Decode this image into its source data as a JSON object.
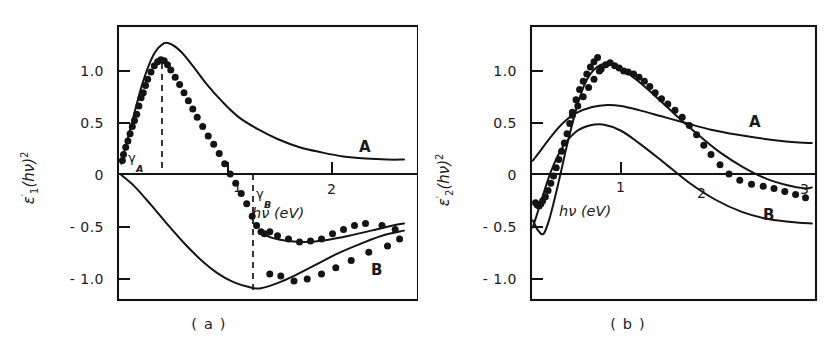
{
  "figure": {
    "background": "#ffffff",
    "ink_color": "#141414"
  },
  "panels": [
    {
      "id": "a",
      "caption": "( a )",
      "y_axis": {
        "label_main": "ε",
        "label_prime": "′",
        "label_sub": "1",
        "label_arg": "(hν)",
        "label_sup": "2",
        "ticks": [
          "1.0",
          "0.5",
          "0",
          "- 0.5",
          "- 1.0"
        ],
        "tick_values": [
          1.0,
          0.5,
          0,
          -0.5,
          -1.0
        ],
        "range": [
          -1.15,
          1.38
        ]
      },
      "x_axis": {
        "label": "hν  (eV)",
        "ticks": [
          "1",
          "2"
        ],
        "tick_values": [
          1,
          2
        ],
        "range": [
          0,
          2.62
        ]
      },
      "annotations": [
        {
          "name": "gamma-a",
          "symbol": "γ",
          "subscript": "A",
          "x": 0.42
        },
        {
          "name": "gamma-b",
          "symbol": "γ",
          "subscript": "B",
          "x": 1.28
        }
      ],
      "curve_labels": [
        {
          "name": "A",
          "x": 2.12,
          "y": 0.22
        },
        {
          "name": "B",
          "x": 2.23,
          "y": -0.78
        }
      ]
    },
    {
      "id": "b",
      "caption": "( b )",
      "y_axis": {
        "label_main": "ε",
        "label_prime": "′",
        "label_sub": "2",
        "label_arg": "(hν)",
        "label_sup": "2",
        "ticks": [
          "1.0",
          "0.5",
          "0",
          "- 0.5",
          "- 1.0"
        ],
        "tick_values": [
          1.0,
          0.5,
          0,
          -0.5,
          -1.0
        ],
        "range": [
          -1.15,
          1.38
        ]
      },
      "x_axis": {
        "label": "hν  (eV)",
        "ticks": [
          "1",
          "2",
          "3"
        ],
        "tick_values": [
          1,
          2,
          3
        ],
        "range": [
          0,
          3.15
        ]
      },
      "annotations": [],
      "curve_labels": [
        {
          "name": "A",
          "x": 2.4,
          "y": 0.44
        },
        {
          "name": "B",
          "x": 2.62,
          "y": -0.3
        }
      ]
    }
  ],
  "chart_data": [
    {
      "type": "line",
      "panel": "a",
      "title": "",
      "xlabel": "hν  (eV)",
      "ylabel": "ε′₁(hν)²",
      "xlim": [
        0,
        2.62
      ],
      "ylim": [
        -1.15,
        1.38
      ],
      "grid": false,
      "legend": "inline-curve-labels",
      "annotations": [
        {
          "label": "γ_A",
          "x": 0.42,
          "style": "vertical-dashed"
        },
        {
          "label": "γ_B",
          "x": 1.28,
          "style": "vertical-dashed"
        }
      ],
      "series": [
        {
          "name": "A",
          "style": "line",
          "x": [
            0.03,
            0.12,
            0.22,
            0.32,
            0.42,
            0.5,
            0.58,
            0.68,
            0.8,
            0.95,
            1.1,
            1.28,
            1.45,
            1.65,
            1.85,
            2.05,
            2.25,
            2.45,
            2.6
          ],
          "y": [
            0.1,
            0.47,
            0.87,
            1.15,
            1.27,
            1.25,
            1.18,
            1.05,
            0.88,
            0.7,
            0.55,
            0.43,
            0.34,
            0.26,
            0.21,
            0.17,
            0.15,
            0.14,
            0.14
          ]
        },
        {
          "name": "B",
          "style": "line",
          "x": [
            0.03,
            0.15,
            0.3,
            0.45,
            0.6,
            0.75,
            0.9,
            1.05,
            1.2,
            1.3,
            1.45,
            1.6,
            1.8,
            2.0,
            2.2,
            2.4,
            2.6
          ],
          "y": [
            -0.01,
            -0.12,
            -0.3,
            -0.49,
            -0.67,
            -0.83,
            -0.96,
            -1.05,
            -1.1,
            -1.11,
            -1.06,
            -0.99,
            -0.88,
            -0.77,
            -0.68,
            -0.6,
            -0.55
          ]
        },
        {
          "name": "fit-lower-A",
          "style": "line",
          "x": [
            1.28,
            1.4,
            1.55,
            1.7,
            1.9,
            2.1,
            2.3,
            2.5,
            2.6
          ],
          "y": [
            -0.56,
            -0.62,
            -0.65,
            -0.66,
            -0.64,
            -0.6,
            -0.55,
            -0.5,
            -0.48
          ]
        },
        {
          "name": "data-points",
          "style": "scatter",
          "x": [
            0.04,
            0.05,
            0.07,
            0.09,
            0.11,
            0.13,
            0.15,
            0.17,
            0.19,
            0.21,
            0.23,
            0.25,
            0.27,
            0.3,
            0.33,
            0.36,
            0.39,
            0.42,
            0.45,
            0.48,
            0.52,
            0.56,
            0.6,
            0.64,
            0.68,
            0.72,
            0.77,
            0.82,
            0.87,
            0.92,
            0.97,
            1.02,
            1.07,
            1.12,
            1.17,
            1.22,
            1.26,
            1.3,
            1.33,
            1.38,
            1.45,
            1.55,
            1.65,
            1.75,
            1.85,
            1.95,
            2.05,
            2.15,
            2.25,
            2.4,
            2.52,
            1.38,
            1.48,
            1.6,
            1.72,
            1.85,
            1.98,
            2.12,
            2.28,
            2.45,
            2.56
          ],
          "y": [
            0.13,
            0.19,
            0.26,
            0.32,
            0.39,
            0.46,
            0.52,
            0.58,
            0.66,
            0.74,
            0.79,
            0.86,
            0.92,
            0.99,
            1.05,
            1.09,
            1.11,
            1.1,
            1.06,
            1.01,
            0.94,
            0.87,
            0.79,
            0.71,
            0.63,
            0.55,
            0.46,
            0.37,
            0.29,
            0.2,
            0.1,
            0.0,
            -0.09,
            -0.19,
            -0.29,
            -0.41,
            -0.5,
            -0.56,
            -0.58,
            -0.56,
            -0.6,
            -0.63,
            -0.66,
            -0.65,
            -0.63,
            -0.58,
            -0.54,
            -0.5,
            -0.48,
            -0.5,
            -0.54,
            -0.97,
            -0.99,
            -1.04,
            -1.02,
            -0.97,
            -0.91,
            -0.84,
            -0.76,
            -0.7,
            -0.63
          ]
        }
      ]
    },
    {
      "type": "line",
      "panel": "b",
      "title": "",
      "xlabel": "hν  (eV)",
      "ylabel": "ε′₂(hν)²",
      "xlim": [
        0,
        3.15
      ],
      "ylim": [
        -1.15,
        1.38
      ],
      "grid": false,
      "legend": "inline-curve-labels",
      "annotations": [],
      "series": [
        {
          "name": "A",
          "style": "line",
          "x": [
            0.02,
            0.1,
            0.22,
            0.35,
            0.5,
            0.68,
            0.85,
            1.0,
            1.2,
            1.45,
            1.7,
            2.0,
            2.3,
            2.6,
            2.9,
            3.12
          ],
          "y": [
            0.13,
            0.22,
            0.36,
            0.49,
            0.59,
            0.65,
            0.67,
            0.66,
            0.62,
            0.56,
            0.5,
            0.43,
            0.38,
            0.34,
            0.31,
            0.3
          ]
        },
        {
          "name": "B",
          "style": "line",
          "x": [
            0.02,
            0.1,
            0.22,
            0.35,
            0.5,
            0.65,
            0.8,
            1.0,
            1.2,
            1.45,
            1.75,
            2.05,
            2.35,
            2.65,
            2.95,
            3.12
          ],
          "y": [
            -0.52,
            -0.3,
            0.02,
            0.26,
            0.41,
            0.47,
            0.48,
            0.42,
            0.3,
            0.13,
            -0.08,
            -0.25,
            -0.37,
            -0.44,
            -0.47,
            -0.48
          ]
        },
        {
          "name": "fit-main",
          "style": "line",
          "x": [
            0.02,
            0.08,
            0.14,
            0.2,
            0.26,
            0.32,
            0.4,
            0.5,
            0.6,
            0.72,
            0.85,
            1.0,
            1.15,
            1.3,
            1.5,
            1.7,
            1.9,
            2.1,
            2.35,
            2.6,
            2.85,
            3.05,
            3.12
          ],
          "y": [
            -0.45,
            -0.55,
            -0.58,
            -0.45,
            -0.25,
            -0.03,
            0.28,
            0.62,
            0.88,
            1.03,
            1.07,
            1.02,
            0.93,
            0.82,
            0.66,
            0.5,
            0.35,
            0.21,
            0.07,
            -0.04,
            -0.11,
            -0.14,
            -0.13
          ]
        },
        {
          "name": "data-points",
          "style": "scatter",
          "x": [
            0.05,
            0.07,
            0.09,
            0.11,
            0.13,
            0.16,
            0.19,
            0.22,
            0.25,
            0.28,
            0.31,
            0.34,
            0.37,
            0.4,
            0.43,
            0.46,
            0.5,
            0.54,
            0.58,
            0.62,
            0.66,
            0.7,
            0.74,
            0.78,
            0.83,
            0.88,
            0.93,
            0.98,
            1.03,
            1.08,
            1.14,
            1.2,
            1.26,
            1.32,
            1.38,
            1.45,
            1.52,
            1.6,
            1.68,
            1.76,
            1.84,
            1.92,
            2.0,
            2.1,
            2.2,
            2.32,
            2.45,
            2.58,
            2.7,
            2.82,
            2.94,
            3.05,
            0.46,
            0.52,
            0.58,
            0.64,
            0.7,
            0.76
          ],
          "y": [
            -0.28,
            -0.3,
            -0.31,
            -0.29,
            -0.26,
            -0.22,
            -0.16,
            -0.09,
            -0.02,
            0.06,
            0.14,
            0.22,
            0.3,
            0.39,
            0.49,
            0.6,
            0.72,
            0.82,
            0.9,
            0.97,
            1.04,
            1.09,
            1.13,
            1.02,
            1.06,
            1.08,
            1.05,
            1.03,
            1.0,
            0.99,
            0.97,
            0.94,
            0.9,
            0.85,
            0.79,
            0.73,
            0.68,
            0.62,
            0.55,
            0.47,
            0.38,
            0.28,
            0.19,
            0.09,
            0.0,
            -0.06,
            -0.1,
            -0.12,
            -0.14,
            -0.17,
            -0.2,
            -0.23,
            0.57,
            0.66,
            0.75,
            0.84,
            0.92,
            1.0
          ]
        }
      ]
    }
  ]
}
